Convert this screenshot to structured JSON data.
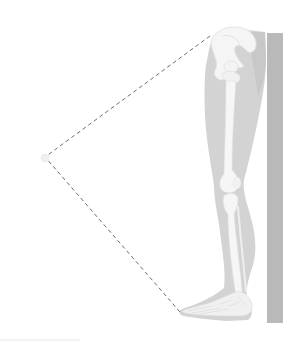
{
  "figure": {
    "colors": {
      "background": "#ffffff",
      "wall": "#b9b9b9",
      "leg_silhouette": "#d4d4d4",
      "leg_shade": "#c9c9c9",
      "bone": "#f4f4f4",
      "bone_edge": "#e2e2e2",
      "dashed_line": "#6e6e6e",
      "vertex_point": "#eeeeee"
    },
    "wall": {
      "x": 267,
      "y": 33,
      "width": 16,
      "height": 290
    },
    "dashed_path": {
      "hip": {
        "x": 210,
        "y": 36
      },
      "vertex": {
        "x": 45,
        "y": 157
      },
      "toe": {
        "x": 180,
        "y": 312
      }
    }
  }
}
